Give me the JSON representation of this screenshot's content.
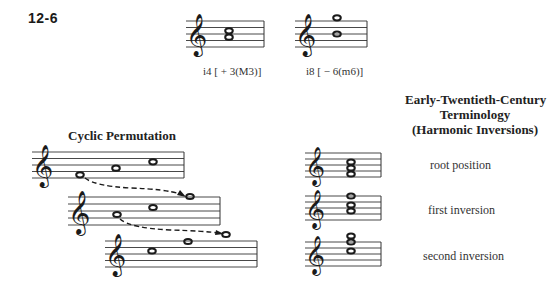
{
  "figure": {
    "number": "12-6"
  },
  "top_examples": [
    {
      "caption": "i4 [ + 3(M3)]",
      "notes": [
        "G4",
        "B4"
      ]
    },
    {
      "caption": "i8 [ − 6(m6)]",
      "notes": [
        "B4",
        "G5"
      ]
    }
  ],
  "cyclic": {
    "title": "Cyclic Permutation",
    "rows": [
      {
        "notes": [
          "E4",
          "G4",
          "C5"
        ]
      },
      {
        "notes": [
          "G4",
          "C5",
          "E5"
        ]
      },
      {
        "notes": [
          "C5",
          "E5",
          "G5"
        ]
      }
    ]
  },
  "terminology": {
    "title_line1": "Early-Twentieth-Century",
    "title_line2": "Terminology",
    "title_line3": "(Harmonic Inversions)",
    "rows": [
      {
        "label": "root position",
        "chord": [
          "E4",
          "G4",
          "C5"
        ]
      },
      {
        "label": "first inversion",
        "chord": [
          "G4",
          "C5",
          "E5"
        ]
      },
      {
        "label": "second inversion",
        "chord": [
          "C5",
          "E5",
          "G5"
        ]
      }
    ]
  },
  "colors": {
    "ink": "#1a1a1a",
    "background": "#ffffff"
  }
}
